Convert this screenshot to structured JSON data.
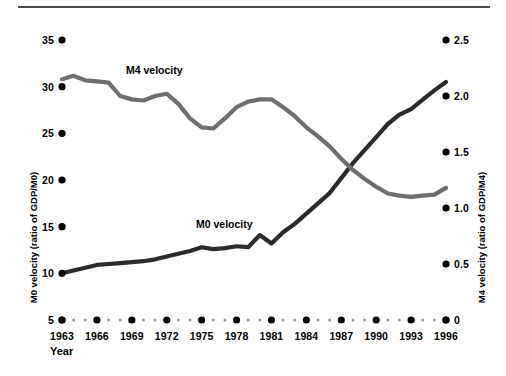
{
  "chart_data": {
    "type": "line",
    "title": "",
    "xlabel": "Year",
    "x": [
      1963,
      1964,
      1965,
      1966,
      1967,
      1968,
      1969,
      1970,
      1971,
      1972,
      1973,
      1974,
      1975,
      1976,
      1977,
      1978,
      1979,
      1980,
      1981,
      1982,
      1983,
      1984,
      1985,
      1986,
      1987,
      1988,
      1989,
      1990,
      1991,
      1992,
      1993,
      1994,
      1995,
      1996
    ],
    "xlim": [
      1963,
      1996
    ],
    "xtick_labels": [
      "1963",
      "1966",
      "1969",
      "1972",
      "1975",
      "1978",
      "1981",
      "1984",
      "1987",
      "1990",
      "1993",
      "1996"
    ],
    "xtick_values": [
      1963,
      1966,
      1969,
      1972,
      1975,
      1978,
      1981,
      1984,
      1987,
      1990,
      1993,
      1996
    ],
    "grid": false,
    "legend_position": "inline-annotations",
    "axes": [
      {
        "id": "left",
        "label": "M0 velocity (ratio of GDP/M0)",
        "ylim": [
          5,
          35
        ],
        "ticks": [
          5,
          10,
          15,
          20,
          25,
          30,
          35
        ],
        "tick_labels": [
          "5",
          "10",
          "15",
          "20",
          "25",
          "30",
          "35"
        ]
      },
      {
        "id": "right",
        "label": "M4 velocity (ratio of GDP/M4)",
        "ylim": [
          0,
          2.5
        ],
        "ticks": [
          0,
          0.5,
          1.0,
          1.5,
          2.0,
          2.5
        ],
        "tick_labels": [
          "0",
          "0.5",
          "1.0",
          "1.5",
          "2.0",
          "2.5"
        ]
      }
    ],
    "series": [
      {
        "name": "M0 velocity",
        "axis": "left",
        "color": "#2b2b2b",
        "annotation": "M0 velocity",
        "values": [
          10.0,
          10.3,
          10.6,
          10.9,
          11.0,
          11.1,
          11.2,
          11.3,
          11.5,
          11.8,
          12.1,
          12.4,
          12.8,
          12.6,
          12.7,
          12.9,
          12.8,
          14.1,
          13.2,
          14.4,
          15.3,
          16.4,
          17.5,
          18.6,
          20.2,
          21.8,
          23.2,
          24.6,
          26.0,
          27.0,
          27.6,
          28.6,
          29.6,
          30.5
        ]
      },
      {
        "name": "M4 velocity",
        "axis": "right",
        "color": "#6e6e6e",
        "annotation": "M4 velocity",
        "values": [
          2.15,
          2.18,
          2.14,
          2.13,
          2.12,
          2.0,
          1.97,
          1.96,
          2.0,
          2.02,
          1.93,
          1.8,
          1.72,
          1.71,
          1.8,
          1.9,
          1.95,
          1.97,
          1.97,
          1.9,
          1.82,
          1.72,
          1.64,
          1.55,
          1.44,
          1.34,
          1.26,
          1.19,
          1.13,
          1.11,
          1.1,
          1.11,
          1.12,
          1.18
        ]
      }
    ]
  }
}
